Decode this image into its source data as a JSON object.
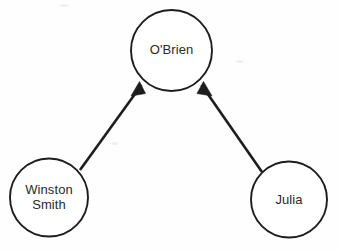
{
  "diagram": {
    "background_color": "#ffffff",
    "stroke_color": "#1d1d1d",
    "text_color": "#2a2a2a",
    "nodes": [
      {
        "id": "obrien",
        "label": "O'Brien",
        "shape": "circle",
        "cx": 171.5,
        "cy": 50.5,
        "r": 40.5
      },
      {
        "id": "winston",
        "label": "Winston\nSmith",
        "label_line1": "Winston",
        "label_line2": "Smith",
        "shape": "circle",
        "cx": 49,
        "cy": 197.5,
        "r": 39
      },
      {
        "id": "julia",
        "label": "Julia",
        "shape": "circle",
        "cx": 289,
        "cy": 199.5,
        "r": 38
      }
    ],
    "edges": [
      {
        "id": "winston-to-obrien",
        "from": "winston",
        "to": "obrien",
        "directed": true,
        "arrow_at": "obrien"
      },
      {
        "id": "julia-to-obrien",
        "from": "julia",
        "to": "obrien",
        "directed": true,
        "arrow_at": "obrien"
      }
    ]
  }
}
